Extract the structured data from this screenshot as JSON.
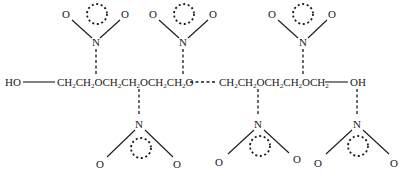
{
  "diagram": {
    "type": "chemical-structure",
    "chain": {
      "left_terminal": "HO",
      "right_terminal": "OH",
      "segment_1": [
        {
          "t": "CH"
        },
        {
          "s": "2"
        },
        {
          "t": "CH"
        },
        {
          "s": "2"
        },
        {
          "t": "OCH"
        },
        {
          "s": "2"
        },
        {
          "t": "CH"
        },
        {
          "s": "2"
        },
        {
          "t": "OCH"
        },
        {
          "s": "2"
        },
        {
          "t": "CH"
        },
        {
          "s": "2"
        },
        {
          "t": "O"
        }
      ],
      "segment_2": [
        {
          "t": "CH"
        },
        {
          "s": "2"
        },
        {
          "t": "CH"
        },
        {
          "s": "2"
        },
        {
          "t": "OCH"
        },
        {
          "s": "2"
        },
        {
          "t": "CH"
        },
        {
          "s": "2"
        },
        {
          "t": "OCH"
        },
        {
          "s": "2"
        }
      ],
      "segment_1_text": "CH2CH2OCH2CH2OCH2CH2O",
      "segment_2_text": "CH2CH2OCH2CH2OCH2"
    },
    "nitro_groups": {
      "top": [
        {
          "n_label": "N",
          "o_left": "O",
          "o_right": "O"
        },
        {
          "n_label": "N",
          "o_left": "O",
          "o_right": "O"
        },
        {
          "n_label": "N",
          "o_left": "O",
          "o_right": "O"
        }
      ],
      "bottom": [
        {
          "n_label": "N",
          "o_left": "O",
          "o_right": "O"
        },
        {
          "n_label": "N",
          "o_left": "O",
          "o_right": "O"
        },
        {
          "n_label": "N",
          "o_left": "O",
          "o_right": "O"
        }
      ]
    },
    "colors": {
      "ink": "#1a1a1a",
      "background": "#ffffff"
    }
  }
}
